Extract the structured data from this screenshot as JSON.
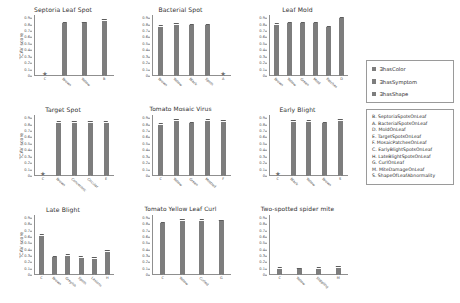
{
  "figure": {
    "ylabel": "TCAV score",
    "bar_color": "#7d7d7d",
    "yticks": [
      "0",
      "0.1",
      "0.2",
      "0.3",
      "0.4",
      "0.5",
      "0.6",
      "0.7",
      "0.8",
      "0.9",
      "1"
    ]
  },
  "legend": {
    "items": [
      {
        "label": "∃hasColor",
        "color": "#7d7d7d"
      },
      {
        "label": "∃hasSymptom",
        "color": "#7d7d7d"
      },
      {
        "label": "∃hasShape",
        "color": "#7d7d7d"
      }
    ]
  },
  "key": {
    "items": [
      "B. SeptoriaSpotsOnLeaf",
      "A. BacterialSpotsOnLeaf",
      "D. MoldOnLeaf",
      "E. TargetSpotsOnLeaf",
      "F. MosaicPatchesOnLeaf",
      "C. EarlyBlightSpotsOnLeaf",
      "H. LateBlightSpotsOnLeaf",
      "G. CurlOnLeaf",
      "M. MiteDamageOnLeaf",
      "S. ShapeOfLeafAbnormality"
    ]
  },
  "chart_data": [
    {
      "type": "bar",
      "title": "Septoria Leaf Spot",
      "ylabel": "TCAV score",
      "xlabel": "",
      "ylim": [
        0,
        0.95
      ],
      "grid": false,
      "categories": [
        "C",
        "Brown",
        "Yellow",
        "B"
      ],
      "values": [
        0.0,
        0.82,
        0.82,
        0.86
      ],
      "starred": [
        "C"
      ]
    },
    {
      "type": "bar",
      "title": "Bacterial Spot",
      "ylabel": "",
      "xlabel": "",
      "ylim": [
        0,
        0.95
      ],
      "grid": false,
      "categories": [
        "Brown",
        "Yellow",
        "Black",
        "Spots",
        "A"
      ],
      "values": [
        0.77,
        0.8,
        0.79,
        0.79,
        0.0
      ],
      "starred": [
        "A"
      ]
    },
    {
      "type": "bar",
      "title": "Leaf Mold",
      "ylabel": "",
      "xlabel": "",
      "ylim": [
        0,
        0.95
      ],
      "grid": false,
      "categories": [
        "Brown",
        "Yellow",
        "Green",
        "Mold",
        "Patches",
        "D"
      ],
      "values": [
        0.8,
        0.82,
        0.82,
        0.82,
        0.76,
        0.9
      ],
      "starred": []
    },
    {
      "type": "bar",
      "title": "Target Spot",
      "ylabel": "TCAV score",
      "xlabel": "",
      "ylim": [
        0,
        0.95
      ],
      "grid": false,
      "categories": [
        "C",
        "Brown",
        "Concentric",
        "Circular",
        "E"
      ],
      "values": [
        0.0,
        0.83,
        0.83,
        0.83,
        0.83
      ],
      "starred": [
        "C"
      ]
    },
    {
      "type": "bar",
      "title": "Tomato Mosaic Virus",
      "ylabel": "",
      "xlabel": "",
      "ylim": [
        0,
        0.95
      ],
      "grid": false,
      "categories": [
        "C",
        "Yellow",
        "Green",
        "Mottled",
        "F"
      ],
      "values": [
        0.8,
        0.86,
        0.82,
        0.86,
        0.84
      ],
      "starred": []
    },
    {
      "type": "bar",
      "title": "Early Blight",
      "ylabel": "",
      "xlabel": "",
      "ylim": [
        0,
        0.95
      ],
      "grid": false,
      "categories": [
        "C",
        "Black",
        "Yellow",
        "Brown",
        "S"
      ],
      "values": [
        0.0,
        0.84,
        0.84,
        0.82,
        0.86
      ],
      "starred": [
        "C"
      ]
    },
    {
      "type": "bar",
      "title": "Late Blight",
      "ylabel": "TCAV score",
      "xlabel": "",
      "ylim": [
        0,
        0.95
      ],
      "grid": false,
      "categories": [
        "C",
        "Brown",
        "Greyish",
        "Spots",
        "Lesions",
        "H"
      ],
      "values": [
        0.62,
        0.28,
        0.3,
        0.27,
        0.26,
        0.37
      ],
      "starred": []
    },
    {
      "type": "bar",
      "title": "Tomato Yellow Leaf Curl",
      "ylabel": "",
      "xlabel": "",
      "ylim": [
        0,
        0.95
      ],
      "grid": false,
      "categories": [
        "C",
        "Yellow",
        "Curled",
        "G"
      ],
      "values": [
        0.82,
        0.86,
        0.86,
        0.85
      ],
      "starred": []
    },
    {
      "type": "bar",
      "title": "Two-spotted spider mite",
      "ylabel": "",
      "xlabel": "",
      "ylim": [
        0,
        0.95
      ],
      "grid": false,
      "categories": [
        "C",
        "Yellow",
        "Stippling",
        "M"
      ],
      "values": [
        0.1,
        0.09,
        0.1,
        0.11
      ],
      "starred": []
    }
  ]
}
